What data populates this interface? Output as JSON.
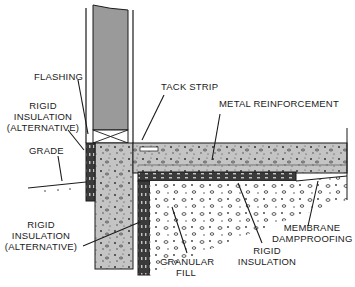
{
  "diagram": {
    "labels": {
      "flashing": "FLASHING",
      "rigid_insulation_alt_upper": [
        "RIGID",
        "INSULATION",
        "(ALTERNATIVE)"
      ],
      "grade": "GRADE",
      "tack_strip": "TACK STRIP",
      "metal_reinforcement": "METAL REINFORCEMENT",
      "rigid_insulation_alt_lower": [
        "RIGID",
        "INSULATION",
        "(ALTERNATIVE)"
      ],
      "granular_fill": [
        "GRANULAR",
        "FILL"
      ],
      "rigid_insulation": [
        "RIGID",
        "INSULATION"
      ],
      "membrane_dampproofing": [
        "MEMBRANE",
        "DAMPPROOFING"
      ]
    },
    "colors": {
      "ink": "#1a1a1a",
      "concrete": "#c4c4c4",
      "stud_panel": "#9a9a9a",
      "insulation": "#3a3a3a",
      "background": "#ffffff"
    }
  }
}
